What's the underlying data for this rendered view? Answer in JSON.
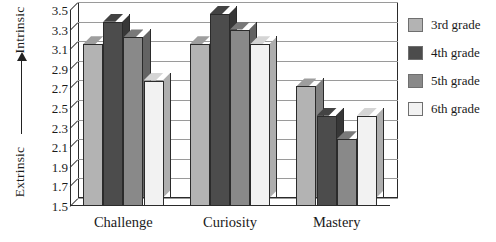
{
  "axis": {
    "vertical_caption_top": "Intrinsic",
    "vertical_caption_bottom": "Extrinsic",
    "arrow_icon": "up-arrow-icon"
  },
  "legend": {
    "items": [
      {
        "label": "3rd grade",
        "color": "#b3b3b3",
        "swatch_name": "legend-swatch-3rd"
      },
      {
        "label": "4th grade",
        "color": "#4c4c4c",
        "swatch_name": "legend-swatch-4th"
      },
      {
        "label": "5th grade",
        "color": "#898989",
        "swatch_name": "legend-swatch-5th"
      },
      {
        "label": "6th grade",
        "color": "#f2f2f2",
        "swatch_name": "legend-swatch-6th"
      }
    ]
  },
  "chart_data": {
    "type": "bar",
    "title": "",
    "xlabel": "",
    "ylabel": "Extrinsic — Intrinsic",
    "categories": [
      "Challenge",
      "Curiosity",
      "Mastery"
    ],
    "ylim": [
      1.5,
      3.5
    ],
    "yticks": [
      1.5,
      1.7,
      1.9,
      2.1,
      2.3,
      2.5,
      2.7,
      2.9,
      3.1,
      3.3,
      3.5
    ],
    "ytick_labels": [
      "1.5",
      "1.7",
      "1.9",
      "2.1",
      "2.3",
      "2.5",
      "2.7",
      "2.9",
      "3.1",
      "3.3",
      "3.5"
    ],
    "grid": true,
    "legend_position": "right",
    "series": [
      {
        "name": "3rd grade",
        "color": "#b3b3b3",
        "values": [
          3.15,
          3.15,
          2.72
        ]
      },
      {
        "name": "4th grade",
        "color": "#4c4c4c",
        "values": [
          3.38,
          3.46,
          2.42
        ]
      },
      {
        "name": "5th grade",
        "color": "#898989",
        "values": [
          3.22,
          3.3,
          2.18
        ]
      },
      {
        "name": "6th grade",
        "color": "#f2f2f2",
        "values": [
          2.78,
          3.15,
          2.42
        ]
      }
    ]
  }
}
